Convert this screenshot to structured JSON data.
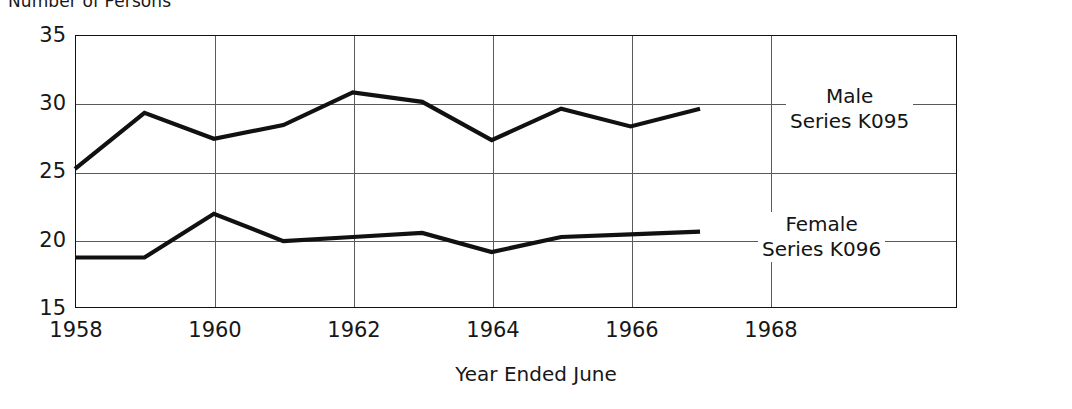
{
  "chart_data": {
    "type": "line",
    "title": "Number of Persons",
    "xlabel": "Year Ended June",
    "ylabel": "",
    "x": [
      1958,
      1959,
      1960,
      1961,
      1962,
      1963,
      1964,
      1965,
      1966,
      1967
    ],
    "xlim": [
      1958,
      1970.7
    ],
    "ylim": [
      15,
      35
    ],
    "ytick_labels": [
      "35",
      "30",
      "25",
      "20",
      "15"
    ],
    "ytick_values": [
      35,
      30,
      25,
      20,
      15
    ],
    "xtick_labels": [
      "1958",
      "1960",
      "1962",
      "1964",
      "1966",
      "1968"
    ],
    "xtick_values": [
      1958,
      1960,
      1962,
      1964,
      1966,
      1968
    ],
    "grid": true,
    "legend_position": "inline-right",
    "series": [
      {
        "name": "Male",
        "series_code": "Series K095",
        "label_line1": "Male",
        "label_line2": "Series K095",
        "color": "#111111",
        "values": [
          25.2,
          29.3,
          27.4,
          28.4,
          30.8,
          30.1,
          27.3,
          29.6,
          28.3,
          29.6
        ]
      },
      {
        "name": "Female",
        "series_code": "Series K096",
        "label_line1": "Female",
        "label_line2": "Series K096",
        "color": "#111111",
        "values": [
          18.7,
          18.7,
          21.9,
          19.9,
          20.2,
          20.5,
          19.1,
          20.2,
          20.4,
          20.6
        ]
      }
    ]
  },
  "axes": {
    "y_ticks": [
      {
        "label": "35"
      },
      {
        "label": "30"
      },
      {
        "label": "25"
      },
      {
        "label": "20"
      },
      {
        "label": "15"
      }
    ],
    "x_ticks": [
      {
        "label": "1958"
      },
      {
        "label": "1960"
      },
      {
        "label": "1962"
      },
      {
        "label": "1964"
      },
      {
        "label": "1966"
      },
      {
        "label": "1968"
      }
    ]
  },
  "annotations": {
    "male_line1": "Male",
    "male_line2": "Series K095",
    "female_line1": "Female",
    "female_line2": "Series K096"
  },
  "colors": {
    "series_line": "#111111",
    "frame": "#111111",
    "gridline": "#5a5a5a",
    "background": "#ffffff",
    "text": "#171717"
  }
}
